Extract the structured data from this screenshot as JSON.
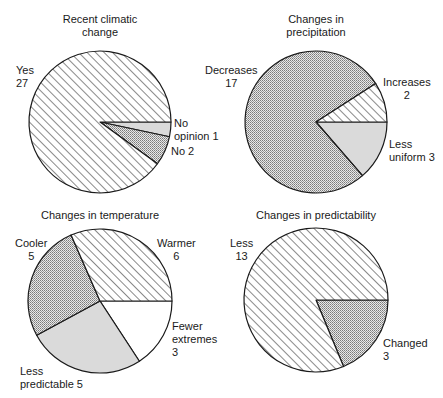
{
  "chart_data": [
    {
      "type": "pie",
      "title": "Recent climatic change",
      "title_lines": [
        "Recent climatic",
        "change"
      ],
      "center": [
        100,
        122
      ],
      "radius": 71,
      "start_angle_deg": 0,
      "direction": "clockwise",
      "slices": [
        {
          "label": "No opinion",
          "value": 1,
          "fill": "lightgrey",
          "label_lines": [
            "No",
            "opinion 1"
          ]
        },
        {
          "label": "No",
          "value": 2,
          "fill": "dots",
          "label_lines": [
            "No 2"
          ]
        },
        {
          "label": "Yes",
          "value": 27,
          "fill": "hatch",
          "label_lines": [
            "Yes",
            "27"
          ]
        }
      ]
    },
    {
      "type": "pie",
      "title": "Changes in precipitation",
      "title_lines": [
        "Changes in",
        "precipitation"
      ],
      "center": [
        316,
        122
      ],
      "radius": 71,
      "start_angle_deg": 0,
      "direction": "clockwise",
      "slices": [
        {
          "label": "Less uniform",
          "value": 3,
          "fill": "lightgrey",
          "label_lines": [
            "Less",
            "uniform 3"
          ]
        },
        {
          "label": "Decreases",
          "value": 17,
          "fill": "dots",
          "label_lines": [
            "Decreases",
            "17"
          ]
        },
        {
          "label": "Increases",
          "value": 2,
          "fill": "hatch",
          "label_lines": [
            "Increases",
            "2"
          ]
        }
      ]
    },
    {
      "type": "pie",
      "title": "Changes in temperature",
      "title_lines": [
        "Changes in temperature"
      ],
      "center": [
        100,
        301
      ],
      "radius": 72,
      "start_angle_deg": 0,
      "direction": "clockwise",
      "slices": [
        {
          "label": "Fewer extremes",
          "value": 3,
          "fill": "white",
          "label_lines": [
            "Fewer",
            "extremes",
            "3"
          ]
        },
        {
          "label": "Less predictable",
          "value": 5,
          "fill": "lightgrey",
          "label_lines": [
            "Less",
            "predictable 5"
          ]
        },
        {
          "label": "Cooler",
          "value": 5,
          "fill": "dots",
          "label_lines": [
            "Cooler",
            "5"
          ]
        },
        {
          "label": "Warmer",
          "value": 6,
          "fill": "hatch",
          "label_lines": [
            "Warmer",
            "6"
          ]
        }
      ]
    },
    {
      "type": "pie",
      "title": "Changes in predictability",
      "title_lines": [
        "Changes in predictability"
      ],
      "center": [
        316,
        300
      ],
      "radius": 72,
      "start_angle_deg": 0,
      "direction": "clockwise",
      "slices": [
        {
          "label": "Changed",
          "value": 3,
          "fill": "dots",
          "label_lines": [
            "Changed",
            "3"
          ]
        },
        {
          "label": "Less",
          "value": 13,
          "fill": "hatch",
          "label_lines": [
            "Less",
            "13"
          ]
        }
      ]
    }
  ],
  "colors": {
    "outline": "#1a1a1a",
    "lightgrey": "#dadada",
    "dots_bg": "#e8e8e8",
    "dots_fg": "#7a7a7a",
    "hatch_line": "#3a3a3a",
    "white": "#ffffff"
  },
  "labels": {
    "p1": {
      "title1": "Recent climatic",
      "title2": "change",
      "yes1": "Yes",
      "yes2": "27",
      "noop1": "No",
      "noop2": "opinion 1",
      "no": "No 2"
    },
    "p2": {
      "title1": "Changes in",
      "title2": "precipitation",
      "dec1": "Decreases",
      "dec2": "17",
      "inc1": "Increases",
      "inc2": "2",
      "lu1": "Less",
      "lu2": "uniform 3"
    },
    "p3": {
      "title": "Changes in temperature",
      "cool1": "Cooler",
      "cool2": "5",
      "warm1": "Warmer",
      "warm2": "6",
      "few1": "Fewer",
      "few2": "extremes",
      "few3": "3",
      "lp1": "Less",
      "lp2": "predictable 5"
    },
    "p4": {
      "title": "Changes in predictability",
      "less1": "Less",
      "less2": "13",
      "ch1": "Changed",
      "ch2": "3"
    }
  }
}
